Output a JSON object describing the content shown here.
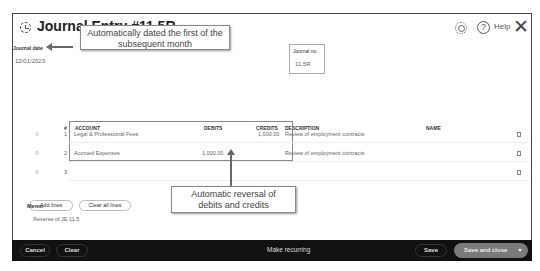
{
  "header": {
    "title": "Journal Entry #11.5R",
    "help_label": "Help",
    "help_glyph": "?",
    "close_glyph": "✕"
  },
  "fields": {
    "journal_date_label": "Journal date",
    "journal_date_value": "12/01/2023",
    "journal_no_label": "Journal no.",
    "journal_no_value": "11.5R"
  },
  "table": {
    "headers": {
      "num": "#",
      "account": "ACCOUNT",
      "debits": "DEBITS",
      "credits": "CREDITS",
      "description": "DESCRIPTION",
      "name": "NAME"
    },
    "rows": [
      {
        "num": "1",
        "account": "Legal & Professional Fees",
        "debits": "",
        "credits": "1,000.00",
        "description": "Review of employment contracts",
        "name": ""
      },
      {
        "num": "2",
        "account": "Accrued Expenses",
        "debits": "1,000.00",
        "credits": "",
        "description": "Review of employment contracts",
        "name": ""
      },
      {
        "num": "3",
        "account": "",
        "debits": "",
        "credits": "",
        "description": "",
        "name": ""
      }
    ],
    "total_label": "Total",
    "total_debits": "1,000.00",
    "total_credits": "1,000.00"
  },
  "actions": {
    "add_lines": "Add lines",
    "clear_all_lines": "Clear all lines"
  },
  "memo": {
    "label": "Memo",
    "value": "Reverse of JE 11.5"
  },
  "annotations": {
    "callout_date_line1": "Automatically dated the first of the",
    "callout_date_line2": "subsequent month",
    "callout_reversal_line1": "Automatic reversal of",
    "callout_reversal_line2": "debits and credits"
  },
  "footer": {
    "cancel": "Cancel",
    "clear": "Clear",
    "make_recurring": "Make recurring",
    "save": "Save",
    "save_and_close": "Save and close"
  }
}
